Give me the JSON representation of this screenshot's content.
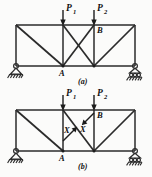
{
  "figure": {
    "panels": [
      {
        "id": "a",
        "caption": "(a)",
        "loads": [
          {
            "name": "P1",
            "base": "P",
            "sub": "1"
          },
          {
            "name": "P2",
            "base": "P",
            "sub": "2"
          }
        ],
        "joint_labels": [
          {
            "name": "A",
            "text": "A"
          },
          {
            "name": "B",
            "text": "B"
          }
        ],
        "supports": [
          {
            "name": "pin-support",
            "type": "pin"
          },
          {
            "name": "roller-support",
            "type": "roller"
          }
        ]
      },
      {
        "id": "b",
        "caption": "(b)",
        "loads": [
          {
            "name": "P1",
            "base": "P",
            "sub": "1"
          },
          {
            "name": "P2",
            "base": "P",
            "sub": "2"
          }
        ],
        "joint_labels": [
          {
            "name": "A",
            "text": "A"
          },
          {
            "name": "B",
            "text": "B"
          }
        ],
        "internal_forces": [
          {
            "name": "X-lower",
            "text": "X"
          },
          {
            "name": "X-upper",
            "text": "X"
          }
        ],
        "supports": [
          {
            "name": "pin-support",
            "type": "pin"
          },
          {
            "name": "roller-support",
            "type": "roller"
          }
        ]
      }
    ],
    "colors": {
      "line": "#2b2b2b",
      "text": "#111111",
      "background": "#fbfbfa"
    }
  }
}
